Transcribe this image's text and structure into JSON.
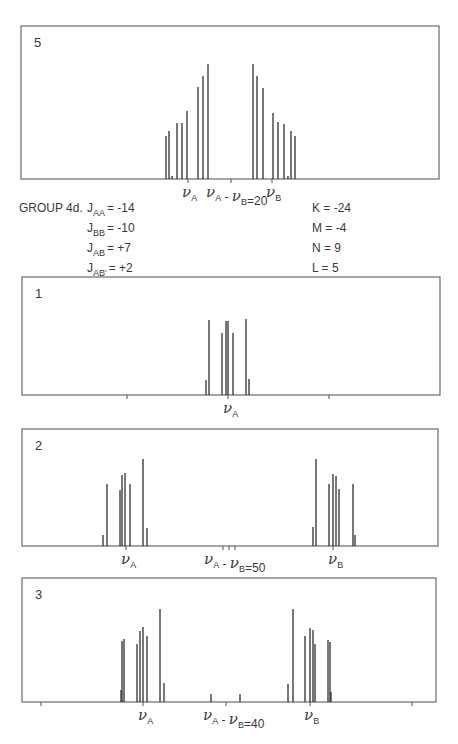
{
  "figure": {
    "group_label": "GROUP 4d.",
    "parameters_left": [
      {
        "name": "J",
        "sub": "AA",
        "value": "= -14"
      },
      {
        "name": "J",
        "sub": "BB",
        "value": "= -10"
      },
      {
        "name": "J",
        "sub": "AB",
        "value": "= +7"
      },
      {
        "name": "J",
        "sub": "AB'",
        "value": "= +2"
      }
    ],
    "parameters_right": [
      {
        "name": "K",
        "value": "= -24"
      },
      {
        "name": "M",
        "value": "= -4"
      },
      {
        "name": "N",
        "value": "= 9"
      },
      {
        "name": "L",
        "value": "= 5"
      }
    ]
  },
  "chart_data": [
    {
      "type": "bar",
      "title": "5",
      "panel_label": "5",
      "frame": {
        "x": 21,
        "y": 26,
        "w": 418,
        "h": 153
      },
      "baseline_y": 179,
      "ticks_x": [
        188,
        231,
        272
      ],
      "labels": [
        {
          "text": "νA",
          "x": 182
        },
        {
          "text": "νA - νB = 20",
          "x": 206
        },
        {
          "text": "νB",
          "x": 266
        }
      ],
      "shift_difference": "νA - νB = 20",
      "x": [
        166,
        169,
        172,
        177,
        182,
        187,
        198,
        203,
        208,
        253,
        257,
        263,
        273,
        278,
        284,
        288,
        291,
        295
      ],
      "values": [
        43,
        48,
        3,
        56,
        56,
        68,
        92,
        103,
        115,
        115,
        103,
        91,
        66,
        57,
        55,
        3,
        48,
        43
      ]
    },
    {
      "type": "bar",
      "title": "1",
      "panel_label": "1",
      "frame": {
        "x": 22,
        "y": 277,
        "w": 418,
        "h": 118
      },
      "baseline_y": 395,
      "ticks_x": [
        127,
        228,
        329
      ],
      "labels": [
        {
          "text": "νA",
          "x": 223
        }
      ],
      "x": [
        206,
        209,
        222,
        226,
        228,
        233,
        246,
        249
      ],
      "values": [
        15,
        75,
        62,
        74,
        74,
        62,
        76,
        16
      ]
    },
    {
      "type": "bar",
      "title": "2",
      "panel_label": "2",
      "frame": {
        "x": 22,
        "y": 429,
        "w": 416,
        "h": 117
      },
      "baseline_y": 546,
      "ticks_x": [
        126,
        223,
        229,
        235,
        333
      ],
      "labels": [
        {
          "text": "νA",
          "x": 121
        },
        {
          "text": "νA - νB = 50",
          "x": 204
        },
        {
          "text": "νB",
          "x": 328
        }
      ],
      "shift_difference": "νA - νB = 50",
      "x": [
        103,
        107,
        120,
        122,
        125,
        130,
        143,
        147,
        313,
        316,
        329,
        333,
        336,
        339,
        353,
        355
      ],
      "values": [
        11,
        62,
        56,
        71,
        73,
        62,
        87,
        18,
        19,
        87,
        62,
        72,
        70,
        57,
        62,
        11
      ]
    },
    {
      "type": "bar",
      "title": "3",
      "panel_label": "3",
      "frame": {
        "x": 22,
        "y": 578,
        "w": 414,
        "h": 124
      },
      "baseline_y": 702,
      "ticks_x": [
        41,
        143,
        226,
        310,
        412
      ],
      "labels": [
        {
          "text": "νA",
          "x": 138
        },
        {
          "text": "νA - νB = 40",
          "x": 203
        },
        {
          "text": "νB",
          "x": 304
        }
      ],
      "shift_difference": "νA - νB = 40",
      "x": [
        121,
        122,
        124,
        137,
        140,
        143,
        147,
        160,
        164,
        211,
        240,
        288,
        293,
        305,
        310,
        313,
        315,
        328,
        330,
        331
      ],
      "values": [
        12,
        61,
        63,
        58,
        71,
        75,
        66,
        93,
        19,
        8,
        8,
        18,
        93,
        66,
        74,
        72,
        58,
        62,
        60,
        10
      ]
    }
  ]
}
